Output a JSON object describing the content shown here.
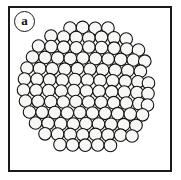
{
  "figure": {
    "panel_label": "a",
    "caption": "",
    "border_color": "#1a1a1a",
    "background_color": "#ffffff"
  },
  "chart_data": {
    "type": "scatter",
    "title": "",
    "subtitle": "",
    "xlabel": "",
    "ylabel": "",
    "grid": false,
    "legend": null,
    "xlim": [
      0,
      181
    ],
    "ylim": [
      0,
      180
    ],
    "circle_style": {
      "fill": "#f7f7f5",
      "stroke": "#111111",
      "stroke_width": 1.1,
      "radius": 6.3
    },
    "cluster": {
      "center_x": 86,
      "center_y": 87,
      "radius": 62,
      "count": 94,
      "row_spacing": 11.1,
      "column_spacing": 12.7
    },
    "points": [
      {
        "x": 70.0,
        "y": 28.0
      },
      {
        "x": 82.6,
        "y": 27.4
      },
      {
        "x": 95.2,
        "y": 28.3
      },
      {
        "x": 108.0,
        "y": 28.0
      },
      {
        "x": 51.0,
        "y": 36.0
      },
      {
        "x": 63.6,
        "y": 37.0
      },
      {
        "x": 76.2,
        "y": 37.4
      },
      {
        "x": 88.8,
        "y": 38.0
      },
      {
        "x": 101.4,
        "y": 37.2
      },
      {
        "x": 114.0,
        "y": 37.8
      },
      {
        "x": 126.2,
        "y": 39.0
      },
      {
        "x": 38.5,
        "y": 46.0
      },
      {
        "x": 51.1,
        "y": 46.6
      },
      {
        "x": 63.7,
        "y": 47.2
      },
      {
        "x": 76.3,
        "y": 47.8
      },
      {
        "x": 88.9,
        "y": 47.0
      },
      {
        "x": 101.5,
        "y": 47.6
      },
      {
        "x": 114.1,
        "y": 48.2
      },
      {
        "x": 126.7,
        "y": 49.0
      },
      {
        "x": 138.5,
        "y": 50.0
      },
      {
        "x": 32.5,
        "y": 57.0
      },
      {
        "x": 45.1,
        "y": 57.4
      },
      {
        "x": 57.7,
        "y": 57.9
      },
      {
        "x": 70.3,
        "y": 58.4
      },
      {
        "x": 82.9,
        "y": 58.0
      },
      {
        "x": 95.5,
        "y": 58.6
      },
      {
        "x": 108.1,
        "y": 59.0
      },
      {
        "x": 120.7,
        "y": 59.4
      },
      {
        "x": 133.3,
        "y": 60.0
      },
      {
        "x": 144.8,
        "y": 61.2
      },
      {
        "x": 27.0,
        "y": 68.0
      },
      {
        "x": 39.6,
        "y": 68.4
      },
      {
        "x": 52.2,
        "y": 68.8
      },
      {
        "x": 64.8,
        "y": 69.2
      },
      {
        "x": 77.4,
        "y": 68.7
      },
      {
        "x": 90.0,
        "y": 69.3
      },
      {
        "x": 102.6,
        "y": 69.8
      },
      {
        "x": 115.2,
        "y": 70.2
      },
      {
        "x": 127.8,
        "y": 70.6
      },
      {
        "x": 140.4,
        "y": 71.2
      },
      {
        "x": 24.5,
        "y": 79.0
      },
      {
        "x": 37.1,
        "y": 79.3
      },
      {
        "x": 49.7,
        "y": 79.7
      },
      {
        "x": 62.3,
        "y": 80.1
      },
      {
        "x": 74.9,
        "y": 79.6
      },
      {
        "x": 87.5,
        "y": 80.0
      },
      {
        "x": 100.1,
        "y": 80.4
      },
      {
        "x": 112.7,
        "y": 80.8
      },
      {
        "x": 125.3,
        "y": 81.2
      },
      {
        "x": 137.9,
        "y": 81.8
      },
      {
        "x": 148.5,
        "y": 83.0
      },
      {
        "x": 23.5,
        "y": 90.0
      },
      {
        "x": 36.1,
        "y": 90.3
      },
      {
        "x": 48.7,
        "y": 90.6
      },
      {
        "x": 61.3,
        "y": 91.0
      },
      {
        "x": 73.9,
        "y": 90.5
      },
      {
        "x": 86.5,
        "y": 91.0
      },
      {
        "x": 99.1,
        "y": 91.3
      },
      {
        "x": 111.7,
        "y": 91.7
      },
      {
        "x": 124.3,
        "y": 92.1
      },
      {
        "x": 136.9,
        "y": 92.6
      },
      {
        "x": 148.0,
        "y": 93.6
      },
      {
        "x": 25.5,
        "y": 101.0
      },
      {
        "x": 38.1,
        "y": 101.3
      },
      {
        "x": 50.7,
        "y": 101.6
      },
      {
        "x": 63.3,
        "y": 102.0
      },
      {
        "x": 75.9,
        "y": 101.5
      },
      {
        "x": 88.5,
        "y": 102.0
      },
      {
        "x": 101.1,
        "y": 102.3
      },
      {
        "x": 113.7,
        "y": 102.7
      },
      {
        "x": 126.3,
        "y": 103.1
      },
      {
        "x": 138.9,
        "y": 103.6
      },
      {
        "x": 147.5,
        "y": 105.0
      },
      {
        "x": 29.5,
        "y": 112.0
      },
      {
        "x": 42.1,
        "y": 112.3
      },
      {
        "x": 54.7,
        "y": 112.6
      },
      {
        "x": 67.3,
        "y": 113.0
      },
      {
        "x": 79.9,
        "y": 112.5
      },
      {
        "x": 92.5,
        "y": 113.0
      },
      {
        "x": 105.1,
        "y": 113.3
      },
      {
        "x": 117.7,
        "y": 113.7
      },
      {
        "x": 130.3,
        "y": 114.1
      },
      {
        "x": 142.5,
        "y": 114.8
      },
      {
        "x": 35.5,
        "y": 123.0
      },
      {
        "x": 48.1,
        "y": 123.3
      },
      {
        "x": 60.7,
        "y": 123.6
      },
      {
        "x": 73.3,
        "y": 124.0
      },
      {
        "x": 85.9,
        "y": 123.5
      },
      {
        "x": 98.5,
        "y": 124.0
      },
      {
        "x": 111.1,
        "y": 124.3
      },
      {
        "x": 123.7,
        "y": 124.7
      },
      {
        "x": 136.0,
        "y": 125.4
      },
      {
        "x": 45.0,
        "y": 133.8
      },
      {
        "x": 57.6,
        "y": 134.1
      },
      {
        "x": 70.2,
        "y": 134.4
      },
      {
        "x": 82.8,
        "y": 134.8
      },
      {
        "x": 95.4,
        "y": 134.4
      },
      {
        "x": 108.0,
        "y": 134.9
      },
      {
        "x": 120.6,
        "y": 135.2
      },
      {
        "x": 132.0,
        "y": 136.0
      },
      {
        "x": 60.0,
        "y": 144.6
      },
      {
        "x": 72.6,
        "y": 144.9
      },
      {
        "x": 85.2,
        "y": 145.2
      },
      {
        "x": 97.8,
        "y": 145.0
      },
      {
        "x": 110.4,
        "y": 145.4
      }
    ]
  }
}
